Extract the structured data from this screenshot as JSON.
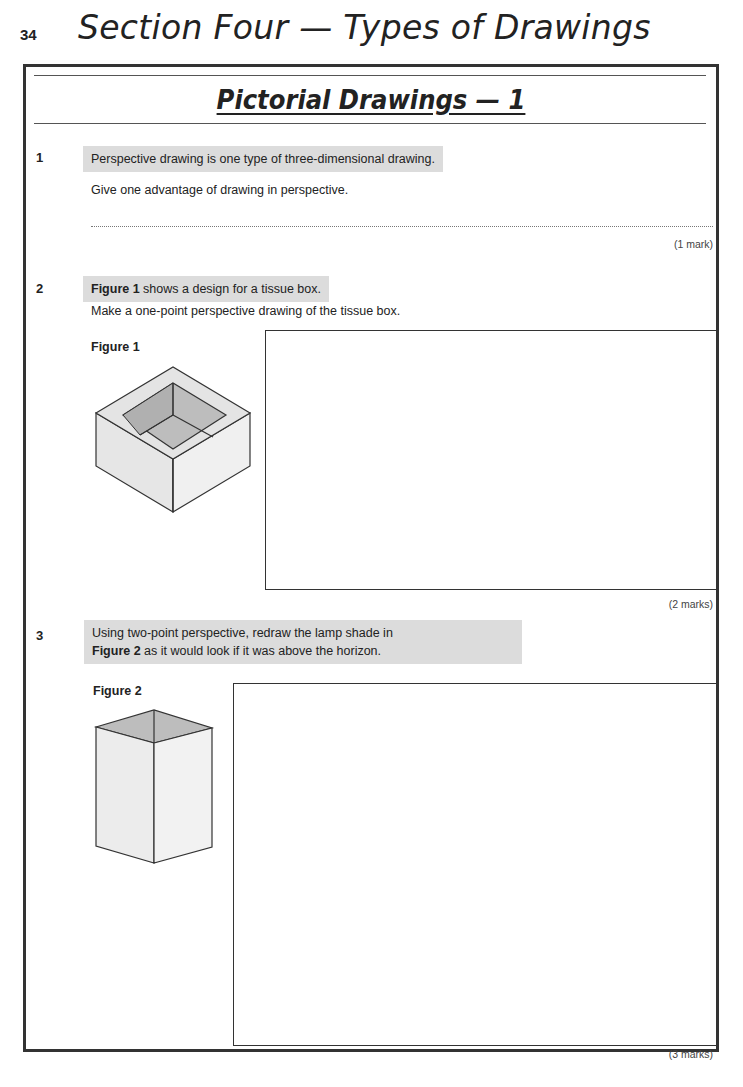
{
  "header": {
    "page_number": "34",
    "section_title": "Section Four — Types of Drawings"
  },
  "page": {
    "title": "Pictorial Drawings — 1"
  },
  "questions": [
    {
      "number": "1",
      "highlight_text": "Perspective drawing is one type of three-dimensional drawing.",
      "prompt": "Give one advantage of drawing in perspective.",
      "answer_line": "dotted",
      "marks": "(1 mark)"
    },
    {
      "number": "2",
      "highlight_bold": "Figure 1",
      "highlight_text": " shows a design for a tissue box.",
      "prompt": "Make a one-point perspective drawing of the tissue box.",
      "figure_label": "Figure 1",
      "figure_description": "tissue box (isometric open-top box)",
      "marks": "(2 marks)"
    },
    {
      "number": "3",
      "highlight_line1": "Using two-point perspective, redraw the lamp shade in",
      "highlight_bold": "Figure 2",
      "highlight_line2": " as it would look if it was above the horizon.",
      "figure_label": "Figure 2",
      "figure_description": "lamp shade (tall rectangular prism)",
      "marks": "(3 marks)"
    }
  ],
  "colors": {
    "highlight": "#dcdcdc",
    "figure_face_light": "#ececec",
    "figure_face_dark": "#bdbdbd",
    "border": "#333333"
  }
}
